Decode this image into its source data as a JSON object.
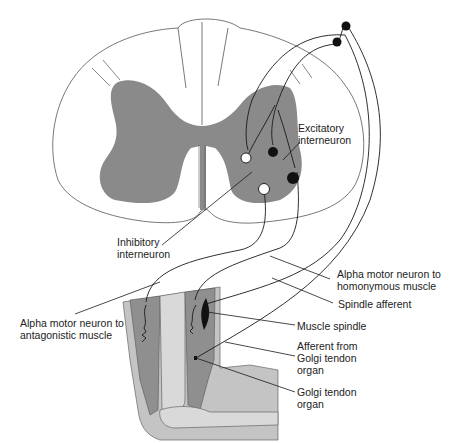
{
  "colors": {
    "gray_matter": "#8a8a8a",
    "white_matter": "#ffffff",
    "muscle": "#8f8f8f",
    "skin": "#c4c4c4",
    "bone": "#d9d9d9",
    "excitatory_neuron": "#111111",
    "inhibitory_neuron": "#ffffff"
  },
  "labels": {
    "excitatory": {
      "line1": "Excitatory",
      "line2": "interneuron"
    },
    "inhibitory": {
      "line1": "Inhibitory",
      "line2": "interneuron"
    },
    "alpha_homonymous": {
      "line1": "Alpha motor neuron to",
      "line2": "homonymous muscle"
    },
    "spindle_afferent": {
      "line1": "Spindle afferent"
    },
    "alpha_antagonistic": {
      "line1": "Alpha motor neuron to",
      "line2": "antagonistic muscle"
    },
    "muscle_spindle": {
      "line1": "Muscle spindle"
    },
    "afferent_gto": {
      "line1": "Afferent from",
      "line2": "Golgi tendon",
      "line3": "organ"
    },
    "gto": {
      "line1": "Golgi tendon",
      "line2": "organ"
    }
  }
}
